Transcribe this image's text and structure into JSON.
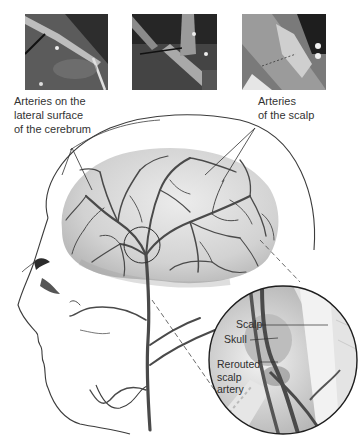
{
  "photos": [
    {
      "name": "surgical-photo-1",
      "alt": "Surgical photo: instrument over exposed vessel"
    },
    {
      "name": "surgical-photo-2",
      "alt": "Surgical photo: vessel being rerouted"
    },
    {
      "name": "surgical-photo-3",
      "alt": "Surgical photo: artery attached to brain surface"
    }
  ],
  "labels": {
    "cerebrum_arteries": "Arteries on the\nlateral surface\nof the cerebrum",
    "scalp_arteries": "Arteries\nof the scalp"
  },
  "inset": {
    "scalp": "Scalp",
    "skull": "Skull",
    "rerouted": "Rerouted\nscalp\nartery"
  },
  "colors": {
    "vessel": "#4a4a4a",
    "brain": "#d9d9d9",
    "outline": "#3c3c3c"
  }
}
